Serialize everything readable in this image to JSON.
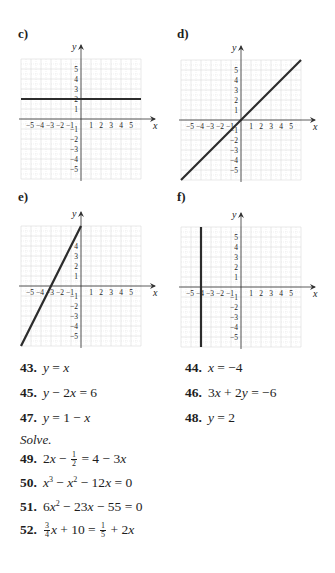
{
  "graphs": [
    {
      "label": "c)",
      "label_pos": [
        18,
        26
      ],
      "origin": [
        81,
        119
      ],
      "unit": 10,
      "grid": {
        "xmin": -6,
        "xmax": 6,
        "ymin": -6,
        "ymax": 6
      },
      "line": {
        "type": "horizontal",
        "y": 2,
        "desc": "y = 2"
      },
      "x_ticks": [
        "-5",
        "-4",
        "-3",
        "-2",
        "-1",
        "1",
        "2",
        "3",
        "4",
        "5"
      ],
      "y_ticks": [
        "5",
        "4",
        "3",
        "2",
        "1",
        "-1",
        "-2",
        "-3",
        "-4",
        "-5"
      ],
      "x_axis_label": "x",
      "y_axis_label": "y"
    },
    {
      "label": "d)",
      "label_pos": [
        177,
        26
      ],
      "origin": [
        241,
        120
      ],
      "unit": 10,
      "grid": {
        "xmin": -6,
        "xmax": 6,
        "ymin": -6,
        "ymax": 6
      },
      "line": {
        "type": "slope",
        "m": 1,
        "b": 0,
        "desc": "y = x"
      },
      "x_ticks": [
        "-5",
        "-4",
        "-3",
        "-2",
        "-1",
        "1",
        "2",
        "3",
        "4",
        "5"
      ],
      "y_ticks": [
        "5",
        "4",
        "3",
        "2",
        "1",
        "-1",
        "-2",
        "-3",
        "-4",
        "-5"
      ],
      "x_axis_label": "x",
      "y_axis_label": "y"
    },
    {
      "label": "e)",
      "label_pos": [
        18,
        189
      ],
      "origin": [
        81,
        286
      ],
      "unit": 10,
      "grid": {
        "xmin": -6,
        "xmax": 6,
        "ymin": -6,
        "ymax": 6
      },
      "line": {
        "type": "slope",
        "m": 2,
        "b": 6,
        "desc": "y - 2x = 6"
      },
      "x_ticks": [
        "-5",
        "-4",
        "-3",
        "-2",
        "-1",
        "1",
        "2",
        "3",
        "4",
        "5"
      ],
      "y_ticks": [
        "4",
        "3",
        "2",
        "1",
        "-1",
        "-2",
        "-3",
        "-4",
        "-5"
      ],
      "x_axis_label": "x",
      "y_axis_label": "y"
    },
    {
      "label": "f)",
      "label_pos": [
        177,
        189
      ],
      "origin": [
        241,
        287
      ],
      "unit": 10,
      "grid": {
        "xmin": -6,
        "xmax": 6,
        "ymin": -6,
        "ymax": 6
      },
      "line": {
        "type": "vertical",
        "x": -4,
        "desc": "x = -4"
      },
      "x_ticks": [
        "-5",
        "-4",
        "-3",
        "-2",
        "-1",
        "1",
        "2",
        "3",
        "4",
        "5"
      ],
      "y_ticks": [
        "5",
        "4",
        "3",
        "2",
        "1",
        "-1",
        "-2",
        "-3",
        "-4",
        "-5"
      ],
      "x_axis_label": "x",
      "y_axis_label": "y"
    }
  ],
  "exercises_left": [
    {
      "num": "43.",
      "eq": "y = x"
    },
    {
      "num": "45.",
      "eq": "y − 2x = 6"
    },
    {
      "num": "47.",
      "eq": "y = 1 − x"
    }
  ],
  "exercises_right": [
    {
      "num": "44.",
      "eq": "x = −4"
    },
    {
      "num": "46.",
      "eq": "3x + 2y = −6"
    },
    {
      "num": "48.",
      "eq": "y = 2"
    }
  ],
  "solve_heading": "Solve.",
  "solve_exercises": [
    {
      "num": "49.",
      "parts": {
        "a": "2x − ",
        "frac_num": "1",
        "frac_den": "2",
        "b": " = 4 − 3x"
      }
    },
    {
      "num": "50.",
      "parts": {
        "a": "x",
        "sup1": "3",
        "b": " − x",
        "sup2": "2",
        "c": " − 12x = 0"
      }
    },
    {
      "num": "51.",
      "parts": {
        "a": "6x",
        "sup1": "2",
        "b": " − 23x − 55 = 0"
      }
    },
    {
      "num": "52.",
      "parts": {
        "f1_num": "3",
        "f1_den": "4",
        "a": "x + 10 = ",
        "f2_num": "1",
        "f2_den": "5",
        "b": " + 2x"
      }
    }
  ],
  "colors": {
    "grid": "#dadada",
    "axis": "#333333",
    "line": "#2b2b2b",
    "text": "#1e1e1e"
  }
}
